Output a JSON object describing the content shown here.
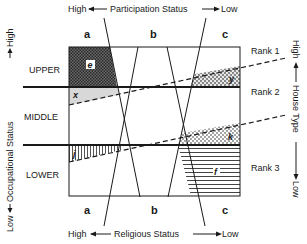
{
  "top_axis": {
    "high": "High",
    "label": "Participation Status",
    "low": "Low"
  },
  "bottom_axis": {
    "high": "High",
    "label": "Religious Status",
    "low": "Low"
  },
  "left_axis": {
    "low": "Low",
    "label": "Occupational Status",
    "high": "High"
  },
  "right_axis": {
    "high": "High",
    "label": "House Type",
    "low": "Low"
  },
  "columns_top": [
    "a",
    "b",
    "c"
  ],
  "columns_bottom": [
    "a",
    "b",
    "c"
  ],
  "rows": [
    "UPPER",
    "MIDDLE",
    "LOWER"
  ],
  "ranks": [
    "Rank 1",
    "Rank 2",
    "Rank 3"
  ],
  "regions": {
    "e": "e",
    "x": "x",
    "y": "y",
    "j": "j",
    "k": "k",
    "f": "f"
  },
  "colors": {
    "ink": "#1a1a1a",
    "dark_fill": "#555555",
    "light_fill": "#dddddd"
  }
}
